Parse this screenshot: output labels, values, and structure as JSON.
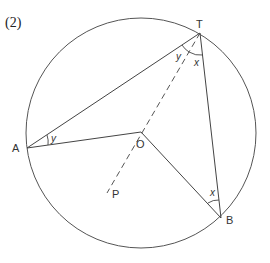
{
  "title": "(2)",
  "points": {
    "T": {
      "label": "T",
      "x": 200,
      "y": 33
    },
    "A": {
      "label": "A",
      "x": 27,
      "y": 148
    },
    "O": {
      "label": "O",
      "x": 141,
      "y": 132
    },
    "B": {
      "label": "B",
      "x": 221,
      "y": 218
    },
    "P": {
      "label": "P",
      "x": 107,
      "y": 193
    }
  },
  "circle": {
    "cx": 141,
    "cy": 133,
    "r": 115,
    "stroke": "#555555"
  },
  "angles": {
    "at_A": "y",
    "at_T_left": "y",
    "at_T_right": "x",
    "at_B": "x"
  },
  "segments": [
    "AT",
    "AO",
    "OB",
    "TB",
    "TP (dashed, through O)"
  ]
}
